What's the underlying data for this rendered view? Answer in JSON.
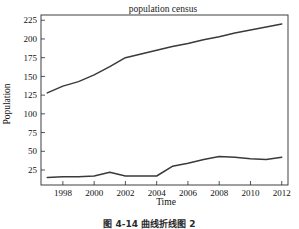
{
  "figure": {
    "caption": "图 4-14  曲线折线图 2"
  },
  "chart_data": {
    "type": "line",
    "title": "population census",
    "xlabel": "Time",
    "ylabel": "Population",
    "xlim": [
      1996.6,
      2012.4
    ],
    "ylim": [
      5,
      232
    ],
    "grid": false,
    "legend": "none",
    "xticks": [
      1998,
      2000,
      2002,
      2004,
      2006,
      2008,
      2010,
      2012
    ],
    "xtick_labels": [
      "1998",
      "2000",
      "2002",
      "2004",
      "2006",
      "2008",
      "2010",
      "2012"
    ],
    "yticks": [
      25,
      50,
      75,
      100,
      125,
      150,
      175,
      200,
      225
    ],
    "ytick_labels": [
      "25",
      "50",
      "75",
      "100",
      "125",
      "150",
      "175",
      "200",
      "225"
    ],
    "x": [
      1997,
      1998,
      1999,
      2000,
      2001,
      2002,
      2003,
      2004,
      2005,
      2006,
      2007,
      2008,
      2009,
      2010,
      2011,
      2012
    ],
    "series": [
      {
        "name": "total population",
        "color": "#3a3a3a",
        "values": [
          128,
          137,
          143,
          152,
          163,
          175,
          180,
          185,
          190,
          194,
          199,
          203,
          208,
          212,
          216,
          220
        ]
      },
      {
        "name": "secondary population",
        "color": "#3a3a3a",
        "values": [
          15,
          16,
          16,
          17,
          22,
          17,
          17,
          17,
          30,
          34,
          39,
          43,
          42,
          40,
          39,
          42
        ]
      }
    ]
  }
}
